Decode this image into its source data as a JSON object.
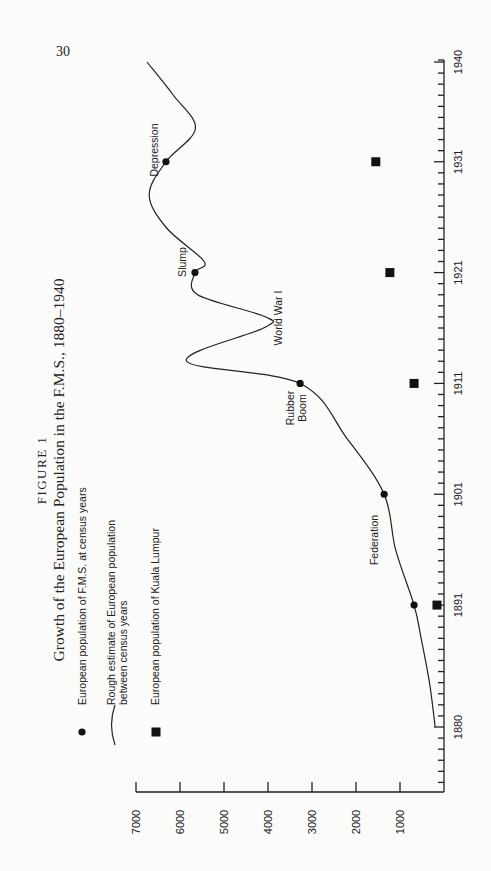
{
  "page_number": "30",
  "figure_label": "FIGURE 1",
  "chart_data": {
    "type": "line",
    "orientation": "rotated-90-ccw",
    "title": "Growth of the European Population in the F.M.S., 1880–1940",
    "xlabel": "",
    "ylabel": "",
    "xlim": [
      1880,
      1940
    ],
    "ylim": [
      0,
      7000
    ],
    "x_ticks": [
      1880,
      1891,
      1901,
      1911,
      1921,
      1931,
      1940
    ],
    "x_tick_labels": [
      "1880",
      "1891",
      "1901",
      "1911",
      "1921",
      "1931",
      "1940"
    ],
    "y_ticks": [
      1000,
      2000,
      3000,
      4000,
      5000,
      6000,
      7000
    ],
    "y_tick_labels": [
      "1000",
      "2000",
      "3000",
      "4000",
      "5000",
      "6000",
      "7000"
    ],
    "grid": false,
    "legend_placement": "left",
    "series": [
      {
        "name": "European population of F.M.S. at census years",
        "marker": "circle",
        "x": [
          1891,
          1901,
          1911,
          1921,
          1931
        ],
        "values": [
          680,
          1360,
          3270,
          5660,
          6320
        ]
      },
      {
        "name": "Rough estimate of European population between census years",
        "marker": "line",
        "x": [
          1880,
          1884,
          1888,
          1891,
          1896,
          1901,
          1906,
          1911,
          1913,
          1916,
          1917,
          1919,
          1921,
          1922,
          1925,
          1928,
          1931,
          1934,
          1937,
          1940
        ],
        "values": [
          200,
          330,
          520,
          680,
          1100,
          1360,
          2200,
          3270,
          5850,
          4100,
          4050,
          5600,
          5660,
          5450,
          6300,
          6700,
          6320,
          5650,
          6150,
          6750
        ]
      },
      {
        "name": "European population of Kuala Lumpur",
        "marker": "square",
        "x": [
          1891,
          1911,
          1921,
          1931
        ],
        "values": [
          160,
          680,
          1230,
          1550
        ]
      }
    ],
    "annotations": [
      {
        "text": "Federation",
        "x": 1896
      },
      {
        "text": "Rubber Boom",
        "x": 1911
      },
      {
        "text": "World War I",
        "x": 1916
      },
      {
        "text": "Slump",
        "x": 1921
      },
      {
        "text": "Depression",
        "x": 1931
      }
    ]
  }
}
